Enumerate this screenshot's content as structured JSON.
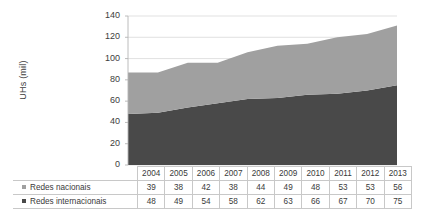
{
  "chart_data": {
    "type": "area",
    "stacked": true,
    "title": "",
    "subtitle": "",
    "xlabel": "",
    "ylabel": "UHs (mil)",
    "categories": [
      "2004",
      "2005",
      "2006",
      "2007",
      "2008",
      "2009",
      "2010",
      "2011",
      "2012",
      "2013"
    ],
    "series": [
      {
        "name": "Redes internacionais",
        "values": [
          48,
          49,
          54,
          58,
          62,
          63,
          66,
          67,
          70,
          75
        ],
        "color": "#494949"
      },
      {
        "name": "Redes nacionais",
        "values": [
          39,
          38,
          42,
          38,
          44,
          49,
          48,
          53,
          53,
          56
        ],
        "color": "#a0a0a0"
      }
    ],
    "totals": [
      87,
      87,
      96,
      96,
      106,
      112,
      114,
      120,
      123,
      131
    ],
    "ylim": [
      0,
      140
    ],
    "ytick_labels": [
      "140",
      "120",
      "100",
      "80",
      "60",
      "40",
      "20",
      "0"
    ],
    "ytick_values": [
      140,
      120,
      100,
      80,
      60,
      40,
      20,
      0
    ],
    "grid": true,
    "grid_color": "#d9d9d9",
    "legend_position": "data-table-left",
    "data_table_visible": true
  },
  "data_table": {
    "header": [
      "",
      "2004",
      "2005",
      "2006",
      "2007",
      "2008",
      "2009",
      "2010",
      "2011",
      "2012",
      "2013"
    ],
    "rows": [
      {
        "label": "Redes nacionais",
        "swatch_color": "#a0a0a0",
        "values": [
          "39",
          "38",
          "42",
          "38",
          "44",
          "49",
          "48",
          "53",
          "53",
          "56"
        ]
      },
      {
        "label": "Redes internacionais",
        "swatch_color": "#494949",
        "values": [
          "48",
          "49",
          "54",
          "58",
          "62",
          "63",
          "66",
          "67",
          "70",
          "75"
        ]
      }
    ]
  }
}
